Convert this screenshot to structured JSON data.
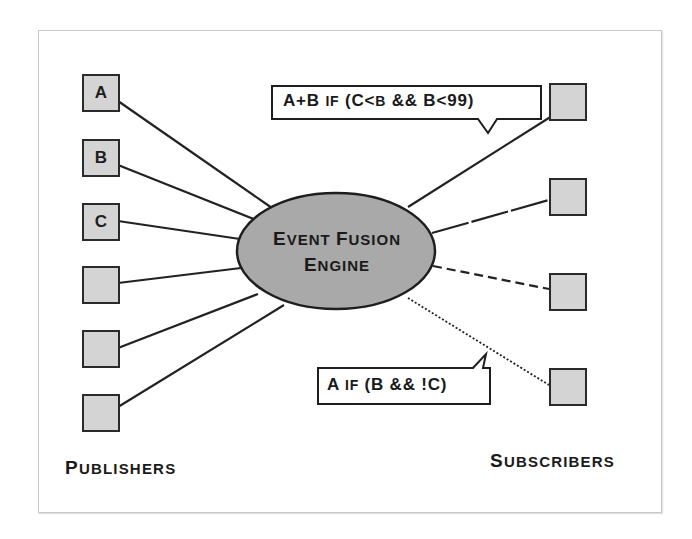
{
  "diagram": {
    "engine": {
      "line1_big": "E",
      "line1_small": "VENT ",
      "line1_big2": "F",
      "line1_small2": "USION",
      "line2_big": "E",
      "line2_small": "NGINE",
      "full_label": "Event Fusion Engine"
    },
    "publishers": {
      "label_big": "P",
      "label_small": "UBLISHERS",
      "items": [
        {
          "label": "A"
        },
        {
          "label": "B"
        },
        {
          "label": "C"
        },
        {
          "label": ""
        },
        {
          "label": ""
        },
        {
          "label": ""
        }
      ]
    },
    "subscribers": {
      "label_big": "S",
      "label_small": "UBSCRIBERS",
      "items": [
        {
          "label": "",
          "line_style": "solid"
        },
        {
          "label": "",
          "line_style": "long-dash"
        },
        {
          "label": "",
          "line_style": "dashed"
        },
        {
          "label": "",
          "line_style": "dotted"
        }
      ]
    },
    "callouts": [
      {
        "text_a": "A+B ",
        "text_if": "IF",
        "text_b": " (C<",
        "text_small_b": "B",
        "text_c": " && B<99)",
        "full_text": "A+B if (C<b && B<99)"
      },
      {
        "text_a": "A ",
        "text_if": "IF",
        "text_b": " (B && !C)",
        "full_text": "A if (B && !C)"
      }
    ],
    "colors": {
      "box_fill": "#d4d4d4",
      "engine_fill": "#a9a9a9",
      "stroke": "#222222",
      "frame": "#c8c8c8"
    }
  }
}
